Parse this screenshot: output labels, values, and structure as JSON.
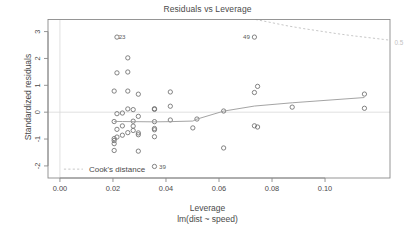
{
  "chart_data": {
    "type": "scatter",
    "title": "Residuals vs Leverage",
    "xlabel": "Leverage",
    "xlabel_sub": "lm(dist ~ speed)",
    "ylabel": "Standardized residuals",
    "xlim": [
      -0.0045,
      0.1245
    ],
    "ylim": [
      -2.45,
      3.45
    ],
    "xticks": [
      0.0,
      0.02,
      0.04,
      0.06,
      0.08,
      0.1
    ],
    "xticklabels": [
      "0.00",
      "0.02",
      "0.04",
      "0.06",
      "0.08",
      "0.10"
    ],
    "yticks": [
      -2,
      -1,
      0,
      1,
      2,
      3
    ],
    "yticklabels": [
      "-2",
      "-1",
      "0",
      "1",
      "2",
      "3"
    ],
    "grid": false,
    "legend": {
      "position": "bottom-left",
      "entries": [
        {
          "label": "Cook's distance",
          "style": "dashed",
          "color": "#bdbdbd"
        }
      ]
    },
    "reference_lines": [
      {
        "orientation": "horizontal",
        "value": 0,
        "color": "#d8d8d8"
      },
      {
        "orientation": "vertical",
        "value": 0,
        "color": "#d8d8d8"
      }
    ],
    "annotations": [
      {
        "text": "23",
        "x": 0.02046,
        "y": 2.795,
        "placement": "right"
      },
      {
        "text": "49",
        "x": 0.07336,
        "y": 2.795,
        "placement": "left"
      },
      {
        "text": "39",
        "x": 0.03566,
        "y": -2.02,
        "placement": "right"
      },
      {
        "text": "0.5",
        "x": 0.1245,
        "y": 2.6,
        "placement": "right",
        "role": "cook-contour-label"
      }
    ],
    "series": [
      {
        "name": "observations",
        "marker": "open-circle",
        "color": "#6e6e6e",
        "points": [
          {
            "x": 0.11486,
            "y": 0.1454
          },
          {
            "x": 0.11486,
            "y": 0.6737
          },
          {
            "x": 0.08761,
            "y": 0.1878
          },
          {
            "x": 0.07336,
            "y": 2.795
          },
          {
            "x": 0.07336,
            "y": -0.5077
          },
          {
            "x": 0.07336,
            "y": 0.7324
          },
          {
            "x": 0.07455,
            "y": 0.9606
          },
          {
            "x": 0.07455,
            "y": -0.5518
          },
          {
            "x": 0.06175,
            "y": 0.0435
          },
          {
            "x": 0.06175,
            "y": -1.3322
          },
          {
            "x": 0.05168,
            "y": -0.2548
          },
          {
            "x": 0.05013,
            "y": -0.5849
          },
          {
            "x": 0.04164,
            "y": 0.7526
          },
          {
            "x": 0.04164,
            "y": 0.2223
          },
          {
            "x": 0.04164,
            "y": -0.2906
          },
          {
            "x": 0.03566,
            "y": 0.1295
          },
          {
            "x": 0.03566,
            "y": 0.1036
          },
          {
            "x": 0.03566,
            "y": -0.3521
          },
          {
            "x": 0.03566,
            "y": -0.6077
          },
          {
            "x": 0.03566,
            "y": -0.6552
          },
          {
            "x": 0.03566,
            "y": -0.9132
          },
          {
            "x": 0.03566,
            "y": -2.02
          },
          {
            "x": 0.02957,
            "y": 0.6696
          },
          {
            "x": 0.02957,
            "y": -0.1556
          },
          {
            "x": 0.02957,
            "y": -0.7717
          },
          {
            "x": 0.02957,
            "y": -0.8392
          },
          {
            "x": 0.02957,
            "y": -1.4505
          },
          {
            "x": 0.02763,
            "y": 0.0957
          },
          {
            "x": 0.02763,
            "y": -0.3348
          },
          {
            "x": 0.02763,
            "y": -0.5183
          },
          {
            "x": 0.02763,
            "y": -0.6806
          },
          {
            "x": 0.0256,
            "y": 2.0219
          },
          {
            "x": 0.0256,
            "y": 1.4958
          },
          {
            "x": 0.0256,
            "y": 0.7864
          },
          {
            "x": 0.0256,
            "y": 0.1205
          },
          {
            "x": 0.0256,
            "y": -0.7616
          },
          {
            "x": 0.02355,
            "y": -0.0316
          },
          {
            "x": 0.02355,
            "y": -0.5106
          },
          {
            "x": 0.02355,
            "y": -0.8573
          },
          {
            "x": 0.02151,
            "y": 2.795
          },
          {
            "x": 0.02151,
            "y": 1.4635
          },
          {
            "x": 0.02151,
            "y": -0.0556
          },
          {
            "x": 0.02151,
            "y": -0.6394
          },
          {
            "x": 0.02151,
            "y": -0.9258
          },
          {
            "x": 0.02046,
            "y": 0.7864
          },
          {
            "x": 0.02046,
            "y": -0.3478
          },
          {
            "x": 0.02046,
            "y": -0.9832
          },
          {
            "x": 0.02046,
            "y": -1.0557
          },
          {
            "x": 0.02046,
            "y": -1.1716
          },
          {
            "x": 0.02046,
            "y": -1.4258
          }
        ]
      }
    ],
    "smooth_line": {
      "name": "loess-smooth",
      "color": "#9a9a9a",
      "points": [
        {
          "x": 0.02046,
          "y": -0.345
        },
        {
          "x": 0.02355,
          "y": -0.348
        },
        {
          "x": 0.02763,
          "y": -0.352
        },
        {
          "x": 0.03566,
          "y": -0.36
        },
        {
          "x": 0.04164,
          "y": -0.352
        },
        {
          "x": 0.05013,
          "y": -0.33
        },
        {
          "x": 0.05168,
          "y": -0.258
        },
        {
          "x": 0.06175,
          "y": 0.04
        },
        {
          "x": 0.07336,
          "y": 0.228
        },
        {
          "x": 0.08761,
          "y": 0.35
        },
        {
          "x": 0.11486,
          "y": 0.545
        }
      ]
    },
    "cook_contours": [
      {
        "level": "0.5",
        "color": "#bdbdbd",
        "style": "dashed",
        "points": [
          {
            "x": 0.0738,
            "y": 3.45
          },
          {
            "x": 0.08,
            "y": 3.33
          },
          {
            "x": 0.086,
            "y": 3.21
          },
          {
            "x": 0.092,
            "y": 3.11
          },
          {
            "x": 0.098,
            "y": 3.02
          },
          {
            "x": 0.104,
            "y": 2.93
          },
          {
            "x": 0.11,
            "y": 2.85
          },
          {
            "x": 0.116,
            "y": 2.78
          },
          {
            "x": 0.122,
            "y": 2.71
          },
          {
            "x": 0.1245,
            "y": 2.68
          }
        ]
      }
    ]
  },
  "legend_ui": {
    "cooks_distance_label": "Cook's distance"
  }
}
